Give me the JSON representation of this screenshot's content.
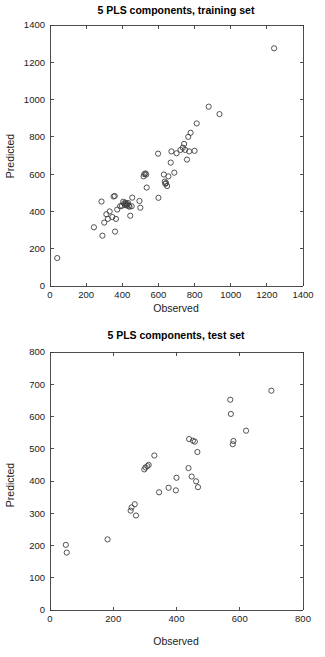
{
  "figures": [
    {
      "id": "training",
      "title": "5  PLS components, training set",
      "xlabel": "Observed",
      "ylabel": "Predicted"
    },
    {
      "id": "test",
      "title": "5  PLS components, test set",
      "xlabel": "Observed",
      "ylabel": "Predicted"
    }
  ],
  "chart_data": [
    {
      "type": "scatter",
      "title": "5  PLS components, training set",
      "xlabel": "Observed",
      "ylabel": "Predicted",
      "xlim": [
        0,
        1400
      ],
      "ylim": [
        0,
        1400
      ],
      "xticks": [
        0,
        200,
        400,
        600,
        800,
        1000,
        1200,
        1400
      ],
      "yticks": [
        0,
        200,
        400,
        600,
        800,
        1000,
        1200,
        1400
      ],
      "grid": false,
      "legend": "none",
      "marker": "open-circle",
      "marker_color": "#404040",
      "series": [
        {
          "name": "training",
          "points": [
            [
              40,
              150
            ],
            [
              243,
              315
            ],
            [
              285,
              453
            ],
            [
              290,
              270
            ],
            [
              300,
              340
            ],
            [
              312,
              385
            ],
            [
              320,
              360
            ],
            [
              330,
              400
            ],
            [
              345,
              370
            ],
            [
              352,
              480
            ],
            [
              358,
              483
            ],
            [
              360,
              292
            ],
            [
              365,
              360
            ],
            [
              372,
              410
            ],
            [
              388,
              428
            ],
            [
              398,
              430
            ],
            [
              405,
              452
            ],
            [
              410,
              443
            ],
            [
              415,
              435
            ],
            [
              418,
              447
            ],
            [
              420,
              440
            ],
            [
              424,
              432
            ],
            [
              428,
              438
            ],
            [
              432,
              445
            ],
            [
              436,
              430
            ],
            [
              440,
              425
            ],
            [
              444,
              377
            ],
            [
              452,
              428
            ],
            [
              455,
              474
            ],
            [
              495,
              456
            ],
            [
              500,
              420
            ],
            [
              518,
              588
            ],
            [
              522,
              600
            ],
            [
              528,
              604
            ],
            [
              532,
              598
            ],
            [
              535,
              528
            ],
            [
              598,
              710
            ],
            [
              600,
              473
            ],
            [
              630,
              598
            ],
            [
              635,
              560
            ],
            [
              638,
              548
            ],
            [
              642,
              552
            ],
            [
              648,
              536
            ],
            [
              655,
              588
            ],
            [
              668,
              662
            ],
            [
              672,
              722
            ],
            [
              688,
              608
            ],
            [
              700,
              712
            ],
            [
              722,
              730
            ],
            [
              735,
              742
            ],
            [
              742,
              762
            ],
            [
              748,
              730
            ],
            [
              758,
              678
            ],
            [
              765,
              800
            ],
            [
              770,
              722
            ],
            [
              778,
              822
            ],
            [
              800,
              725
            ],
            [
              812,
              872
            ],
            [
              878,
              962
            ],
            [
              938,
              922
            ],
            [
              1240,
              1275
            ]
          ]
        }
      ]
    },
    {
      "type": "scatter",
      "title": "5  PLS components, test set",
      "xlabel": "Observed",
      "ylabel": "Predicted",
      "xlim": [
        0,
        800
      ],
      "ylim": [
        0,
        800
      ],
      "xticks": [
        0,
        200,
        400,
        600,
        800
      ],
      "yticks": [
        0,
        100,
        200,
        300,
        400,
        500,
        600,
        700,
        800
      ],
      "grid": false,
      "legend": "none",
      "marker": "open-circle",
      "marker_color": "#404040",
      "series": [
        {
          "name": "test",
          "points": [
            [
              50,
              202
            ],
            [
              53,
              178
            ],
            [
              182,
              219
            ],
            [
              255,
              308
            ],
            [
              258,
              318
            ],
            [
              268,
              328
            ],
            [
              272,
              293
            ],
            [
              298,
              436
            ],
            [
              302,
              442
            ],
            [
              308,
              446
            ],
            [
              312,
              450
            ],
            [
              330,
              479
            ],
            [
              345,
              365
            ],
            [
              375,
              379
            ],
            [
              398,
              371
            ],
            [
              400,
              410
            ],
            [
              438,
              440
            ],
            [
              440,
              530
            ],
            [
              448,
              414
            ],
            [
              452,
              525
            ],
            [
              458,
              522
            ],
            [
              462,
              399
            ],
            [
              466,
              490
            ],
            [
              468,
              381
            ],
            [
              570,
              652
            ],
            [
              572,
              608
            ],
            [
              578,
              514
            ],
            [
              580,
              524
            ],
            [
              620,
              556
            ],
            [
              700,
              680
            ]
          ]
        }
      ]
    }
  ]
}
